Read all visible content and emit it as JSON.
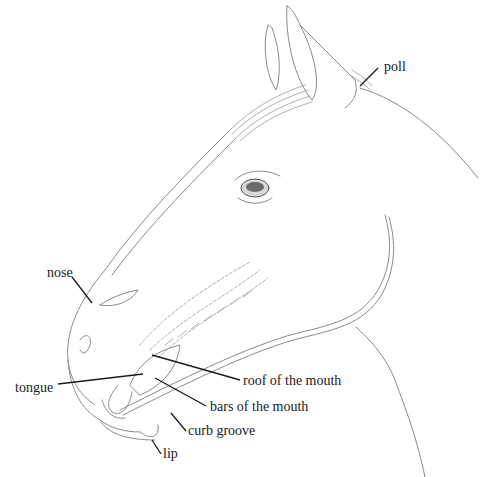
{
  "diagram": {
    "labels": [
      {
        "id": "poll",
        "text": "poll",
        "x": 384,
        "y": 60
      },
      {
        "id": "nose",
        "text": "nose",
        "x": 47,
        "y": 266
      },
      {
        "id": "tongue",
        "text": "tongue",
        "x": 15,
        "y": 381
      },
      {
        "id": "roof",
        "text": "roof of the mouth",
        "x": 243,
        "y": 374
      },
      {
        "id": "bars",
        "text": "bars of the mouth",
        "x": 210,
        "y": 400
      },
      {
        "id": "curb",
        "text": "curb groove",
        "x": 188,
        "y": 424
      },
      {
        "id": "lip",
        "text": "lip",
        "x": 163,
        "y": 447
      }
    ],
    "colors": {
      "ink": "#1a1a1a",
      "sketch": "#8a8a8a",
      "background": "#ffffff"
    }
  }
}
